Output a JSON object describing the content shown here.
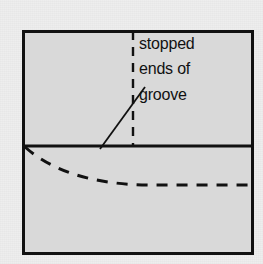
{
  "figure": {
    "kind": "engineering-drawing",
    "title_text": "",
    "background_color": "#eeeeee",
    "body_fill_color": "#d9d9d9",
    "line_color": "#111111",
    "outer_frame": {
      "name": "component-outline",
      "x": 22,
      "y": 30,
      "width": 232,
      "height": 225,
      "stroke_width": 3
    },
    "horizontal_divider": {
      "name": "section-divider-line",
      "x1": 22,
      "y1": 146,
      "x2": 254,
      "y2": 146,
      "stroke_width": 3
    },
    "vertical_dashed_line": {
      "name": "groove-end-centerline",
      "x1": 133,
      "y1": 31,
      "x2": 133,
      "y2": 146,
      "stroke_width": 2.4,
      "dash_pattern": "9 7"
    },
    "dashed_curve": {
      "name": "hidden-groove-profile",
      "path": "M 25 147 C 60 178 110 185 152 185 L 254 185",
      "stroke_width": 3,
      "dash_pattern": "11 9"
    },
    "leader_line": {
      "name": "annotation-leader-line",
      "x1": 100,
      "y1": 149,
      "x2": 145,
      "y2": 87,
      "stroke_width": 1.8
    }
  },
  "annotation": {
    "name": "stopped-ends-of-groove-label",
    "lines": [
      "stopped",
      "ends of",
      "groove"
    ],
    "full_text": "stopped ends of groove",
    "font_size_px": 16,
    "color": "#111111"
  }
}
